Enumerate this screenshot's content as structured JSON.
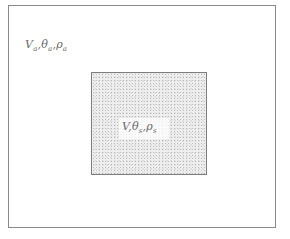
{
  "diagram": {
    "outer_region": {
      "label": {
        "velocity": "V",
        "velocity_sub": "a",
        "temperature": "θ",
        "temperature_sub": "a",
        "density": "ρ",
        "density_sub": "a",
        "separator": ","
      }
    },
    "inner_region": {
      "label": {
        "velocity": "V",
        "temperature": "θ",
        "temperature_sub": "s",
        "density": "ρ",
        "density_sub": "s",
        "separator": ","
      }
    }
  }
}
